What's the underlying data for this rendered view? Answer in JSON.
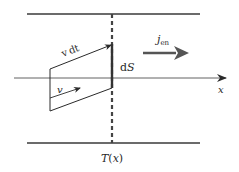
{
  "diagram": {
    "type": "physics-flux-diagram",
    "labels": {
      "vdt": "v dt",
      "v": "v",
      "dS": "dS",
      "dS_d": "d",
      "dS_S": "S",
      "j_main": "j",
      "j_sub": "en",
      "x_axis": "x",
      "temperature": "T(x)",
      "T": "T",
      "T_arg_open": "(",
      "T_arg": "x",
      "T_arg_close": ")"
    },
    "colors": {
      "line": "#3a3a3a",
      "thick_arrow": "#555555",
      "axis": "#3a3a3a",
      "text": "#2a2a2a"
    }
  }
}
